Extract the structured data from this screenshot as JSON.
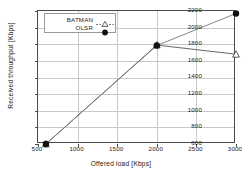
{
  "chart_data": {
    "type": "line",
    "title": "",
    "xlabel": "Offered load [Kbps]",
    "ylabel": "Received throughput [Kbps]",
    "xlim": [
      500,
      3000
    ],
    "ylim": [
      600,
      2200
    ],
    "xticks": [
      500,
      1000,
      1500,
      2000,
      2500,
      3000
    ],
    "yticks": [
      600,
      800,
      1000,
      1200,
      1400,
      1600,
      1800,
      2000,
      2200
    ],
    "xtick_labels": [
      "500",
      "1000",
      "1500",
      "2000",
      "2500",
      "3000"
    ],
    "ytick_labels": [
      "600",
      "800",
      "1000",
      "1200",
      "1400",
      "1600",
      "1800",
      "2000",
      "2200"
    ],
    "grid": true,
    "legend_position": "upper left (inside axes)",
    "series": [
      {
        "name": "BATMAN",
        "marker": "open-triangle-up",
        "line_color": "#555555",
        "marker_fill": "#ffffff",
        "x": [
          600,
          2000,
          3000
        ],
        "y": [
          600,
          1790,
          1680
        ]
      },
      {
        "name": "OLSR",
        "marker": "filled-circle",
        "line_color": "#777777",
        "marker_fill": "#101010",
        "x": [
          600,
          2000,
          3000
        ],
        "y": [
          600,
          1785,
          2170
        ]
      }
    ]
  },
  "legend": {
    "items": [
      {
        "label": "BATMAN",
        "marker": "open-triangle-up"
      },
      {
        "label": "OLSR",
        "marker": "filled-circle"
      }
    ]
  },
  "colors": {
    "axis": "#4a4a4a",
    "grid": "#c9c9c9",
    "batman_line": "#555555",
    "olsr_line": "#777777",
    "marker_dark": "#101010",
    "background": "#ffffff"
  }
}
